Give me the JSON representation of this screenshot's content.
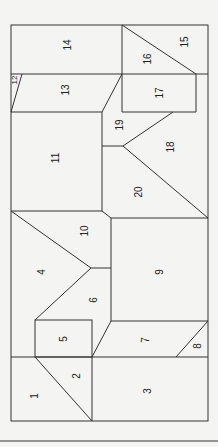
{
  "diagram": {
    "type": "floor-plan",
    "stroke_color": "#333333",
    "background": "#f4f4f2",
    "labels": [
      {
        "id": "1",
        "text": "1",
        "x": 35,
        "y": 396
      },
      {
        "id": "2",
        "text": "2",
        "x": 77,
        "y": 376
      },
      {
        "id": "3",
        "text": "3",
        "x": 148,
        "y": 391
      },
      {
        "id": "4",
        "text": "4",
        "x": 42,
        "y": 272
      },
      {
        "id": "5",
        "text": "5",
        "x": 64,
        "y": 339
      },
      {
        "id": "6",
        "text": "6",
        "x": 94,
        "y": 300
      },
      {
        "id": "7",
        "text": "7",
        "x": 146,
        "y": 340
      },
      {
        "id": "8",
        "text": "8",
        "x": 198,
        "y": 346
      },
      {
        "id": "9",
        "text": "9",
        "x": 160,
        "y": 272
      },
      {
        "id": "10",
        "text": "10",
        "x": 85,
        "y": 231
      },
      {
        "id": "11",
        "text": "11",
        "x": 56,
        "y": 158
      },
      {
        "id": "12",
        "text": "12",
        "x": 15,
        "y": 80
      },
      {
        "id": "13",
        "text": "13",
        "x": 66,
        "y": 90
      },
      {
        "id": "14",
        "text": "14",
        "x": 68,
        "y": 45
      },
      {
        "id": "15",
        "text": "15",
        "x": 185,
        "y": 42
      },
      {
        "id": "16",
        "text": "16",
        "x": 148,
        "y": 59
      },
      {
        "id": "17",
        "text": "17",
        "x": 160,
        "y": 93
      },
      {
        "id": "18",
        "text": "18",
        "x": 171,
        "y": 147
      },
      {
        "id": "19",
        "text": "19",
        "x": 120,
        "y": 125
      },
      {
        "id": "20",
        "text": "20",
        "x": 139,
        "y": 192
      }
    ]
  }
}
